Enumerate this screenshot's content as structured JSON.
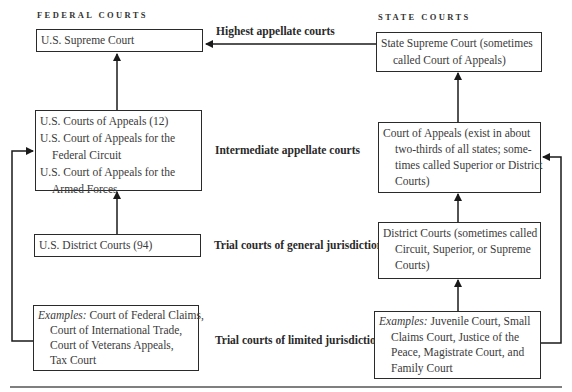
{
  "headers": {
    "federal": "FEDERAL COURTS",
    "state": "STATE COURTS"
  },
  "levels": [
    {
      "label": "Highest appellate courts"
    },
    {
      "label": "Intermediate appellate courts"
    },
    {
      "label": "Trial courts of general jurisdiction"
    },
    {
      "label": "Trial courts of limited jurisdiction"
    }
  ],
  "federal": {
    "supreme": {
      "lines": [
        "U.S. Supreme Court"
      ]
    },
    "appeals": {
      "lines": [
        "U.S. Courts of Appeals (12)",
        "U.S. Court of Appeals for the",
        "Federal Circuit",
        "U.S. Court of Appeals for the",
        "Armed Forces"
      ]
    },
    "district": {
      "lines": [
        "U.S. District Courts (94)"
      ]
    },
    "limited": {
      "prefix": "Examples:",
      "lines": [
        " Court of Federal Claims,",
        "Court of International Trade,",
        "Court of Veterans Appeals,",
        "Tax Court"
      ]
    }
  },
  "state": {
    "supreme": {
      "lines": [
        "State Supreme Court (sometimes",
        "called Court of Appeals)"
      ]
    },
    "appeals": {
      "lines": [
        "Court of Appeals (exist in about",
        "two-thirds of all states; some-",
        "times called Superior or District",
        "Courts)"
      ]
    },
    "district": {
      "lines": [
        "District Courts (sometimes called",
        "Circuit, Superior, or Supreme",
        "Courts)"
      ]
    },
    "limited": {
      "prefix": "Examples:",
      "lines": [
        " Juvenile Court, Small",
        "Claims Court, Justice of the",
        "Peace, Magistrate Court, and",
        "Family Court"
      ]
    }
  }
}
